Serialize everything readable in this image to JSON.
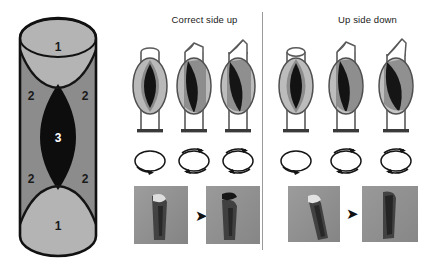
{
  "figure": {
    "background": "#ffffff",
    "divider_color": "#9a9a9a"
  },
  "legend": {
    "name": "capillary-cross-section-legend",
    "shape": "capsule",
    "zone_colors": {
      "zone1": "#b4b4b4",
      "zone2": "#8c8c8c",
      "zone3": "#0d0d0d",
      "outline": "#111111"
    },
    "labels": [
      {
        "text": "1",
        "color": "#1a1a1a",
        "position": "top"
      },
      {
        "text": "2",
        "color": "#1a1a1a",
        "position": "upper-left"
      },
      {
        "text": "2",
        "color": "#1a1a1a",
        "position": "upper-right"
      },
      {
        "text": "3",
        "color": "#ffffff",
        "position": "center"
      },
      {
        "text": "2",
        "color": "#1a1a1a",
        "position": "lower-left"
      },
      {
        "text": "2",
        "color": "#1a1a1a",
        "position": "lower-right"
      },
      {
        "text": "1",
        "color": "#1a1a1a",
        "position": "bottom"
      }
    ]
  },
  "panels": [
    {
      "id": "correct-side-up",
      "title": "Correct side up",
      "tubes": [
        {
          "id": "tube-1",
          "rotation_step": 0,
          "bevel": "flat-ellipse",
          "fill_skew": 0
        },
        {
          "id": "tube-2",
          "rotation_step": 1,
          "bevel": "slight",
          "fill_skew": 1
        },
        {
          "id": "tube-3",
          "rotation_step": 2,
          "bevel": "steep",
          "fill_skew": 2
        }
      ],
      "rotation_markers": [
        {
          "id": "rot-1",
          "arrows": 1
        },
        {
          "id": "rot-2",
          "arrows": 2
        },
        {
          "id": "rot-3",
          "arrows": 2
        }
      ],
      "photos": [
        {
          "id": "photo-before",
          "caption": ""
        },
        {
          "id": "photo-after",
          "caption": ""
        }
      ],
      "photo_arrow": "➤"
    },
    {
      "id": "up-side-down",
      "title": "Up side down",
      "tubes": [
        {
          "id": "tube-1",
          "rotation_step": 0,
          "bevel": "flat-ellipse",
          "fill_skew": 0
        },
        {
          "id": "tube-2",
          "rotation_step": 1,
          "bevel": "slight",
          "fill_skew": 1
        },
        {
          "id": "tube-3",
          "rotation_step": 2,
          "bevel": "steep",
          "fill_skew": 2
        }
      ],
      "rotation_markers": [
        {
          "id": "rot-1",
          "arrows": 1
        },
        {
          "id": "rot-2",
          "arrows": 2
        },
        {
          "id": "rot-3",
          "arrows": 2
        }
      ],
      "photos": [
        {
          "id": "photo-before",
          "caption": ""
        },
        {
          "id": "photo-after",
          "caption": ""
        }
      ],
      "photo_arrow": "➤"
    }
  ]
}
